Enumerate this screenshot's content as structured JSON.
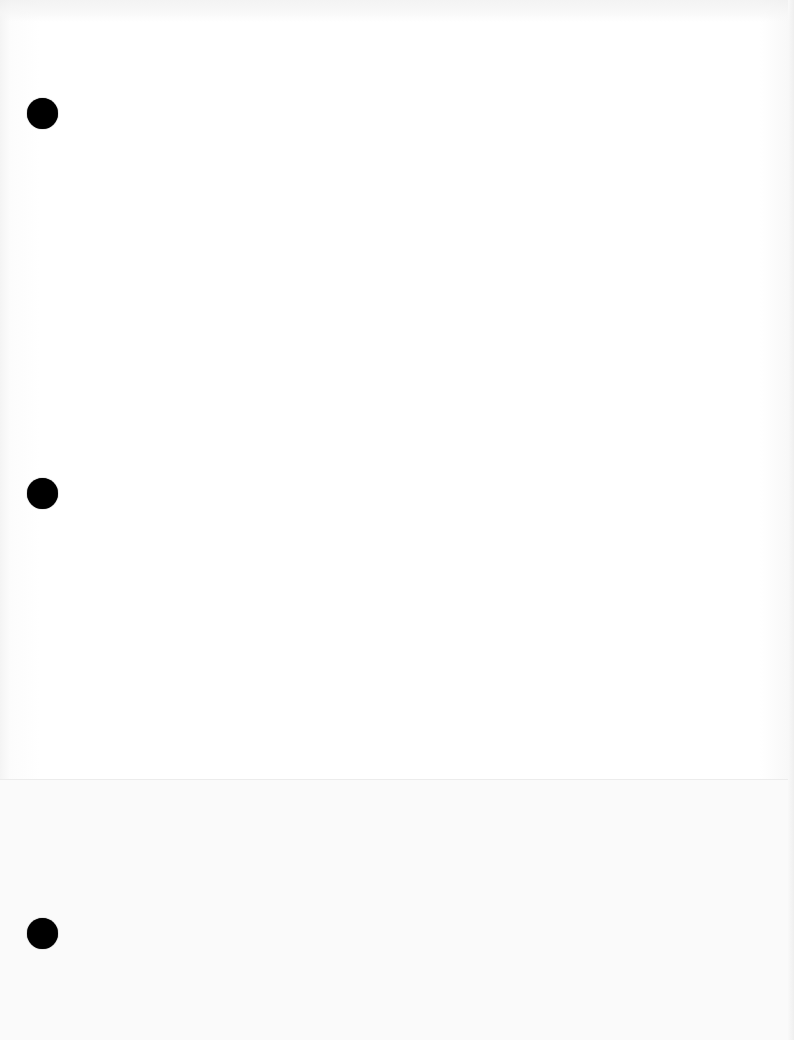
{
  "document": {
    "type": "blank-scanned-page",
    "background_color": "#ffffff",
    "punch_holes": [
      {
        "id": "top",
        "x": 42,
        "y": 113,
        "diameter": 31,
        "color": "#000000"
      },
      {
        "id": "middle",
        "x": 42,
        "y": 493,
        "diameter": 31,
        "color": "#000000"
      },
      {
        "id": "bottom",
        "x": 42,
        "y": 933,
        "diameter": 31,
        "color": "#000000"
      }
    ],
    "text_content": ""
  }
}
